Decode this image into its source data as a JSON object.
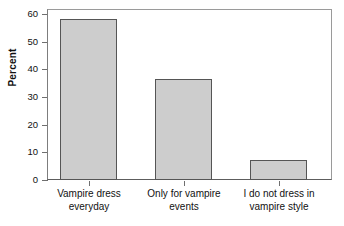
{
  "chart_data": {
    "type": "bar",
    "title": "",
    "subtitle": "",
    "xlabel": "",
    "ylabel": "Percent",
    "categories": [
      "Vampire dress\neveryday",
      "Only for vampire\nevents",
      "I do not dress in\nvampire style"
    ],
    "values": [
      56.7,
      35.7,
      6.9
    ],
    "ylim": [
      0,
      60
    ],
    "yticks": [
      0,
      10,
      20,
      30,
      40,
      50,
      60
    ],
    "ytick_labels": [
      "0",
      "10",
      "20",
      "30",
      "40",
      "50",
      "60"
    ],
    "grid": false,
    "legend": false,
    "legend_position": "none",
    "bar_fill_color": "#cdcdcd",
    "bar_edge_color": "#555555",
    "axis_color": "#6f6f6f",
    "frame_color": "#8d8d8d",
    "background_color": "#ffffff",
    "text_color": "#111111"
  }
}
